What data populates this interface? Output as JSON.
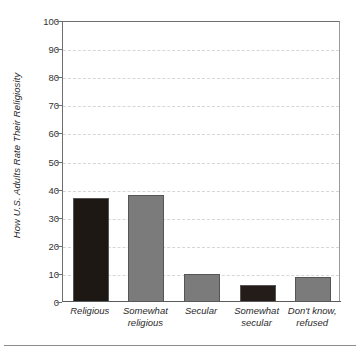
{
  "chart_data": {
    "type": "bar",
    "title": "",
    "subtitle": "",
    "xlabel": "",
    "ylabel": "How U.S. Adults Rate Their Religiosity",
    "categories": [
      "Religious",
      "Somewhat religious",
      "Secular",
      "Somewhat secular",
      "Don't know, refused"
    ],
    "category_lines": [
      [
        "Religious"
      ],
      [
        "Somewhat",
        "religious"
      ],
      [
        "Secular"
      ],
      [
        "Somewhat",
        "secular"
      ],
      [
        "Don't know,",
        "refused"
      ]
    ],
    "values": [
      37,
      38,
      10,
      6,
      9
    ],
    "bar_colors": [
      "#1d1814",
      "#7b7b7b",
      "#7b7b7b",
      "#231c18",
      "#7b7b7b"
    ],
    "ylim": [
      0,
      100
    ],
    "yticks": [
      0,
      10,
      20,
      30,
      40,
      50,
      60,
      70,
      80,
      90,
      100
    ],
    "ytick_labels": [
      "0",
      "10",
      "20",
      "30",
      "40",
      "50",
      "60",
      "70",
      "80",
      "90",
      "100"
    ],
    "grid": true,
    "grid_axis": "y",
    "grid_style": "dashed",
    "grid_color": "#d6d6d6",
    "legend": false,
    "legend_position": "none",
    "axis_color": "#6e6e6e",
    "background": "#ffffff"
  }
}
